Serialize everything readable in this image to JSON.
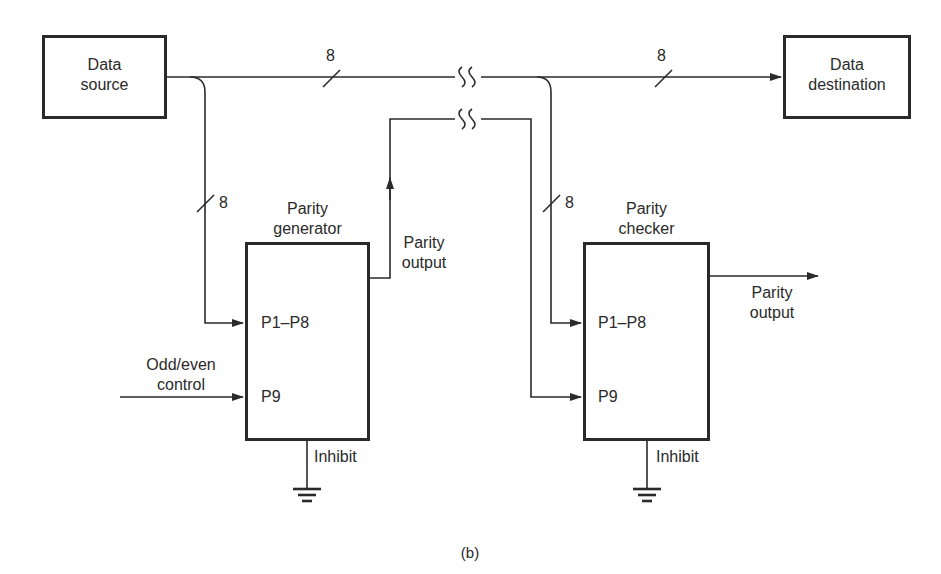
{
  "diagram": {
    "caption": "(b)",
    "blocks": {
      "data_source": {
        "line1": "Data",
        "line2": "source"
      },
      "data_destination": {
        "line1": "Data",
        "line2": "destination"
      },
      "parity_generator": {
        "title_line1": "Parity",
        "title_line2": "generator",
        "inputs": {
          "p1_p8": "P1–P8",
          "p9": "P9"
        },
        "output_label_line1": "Parity",
        "output_label_line2": "output",
        "inhibit": "Inhibit"
      },
      "parity_checker": {
        "title_line1": "Parity",
        "title_line2": "checker",
        "inputs": {
          "p1_p8": "P1–P8",
          "p9": "P9"
        },
        "output_label_line1": "Parity",
        "output_label_line2": "output",
        "inhibit": "Inhibit"
      }
    },
    "control": {
      "line1": "Odd/even",
      "line2": "control"
    },
    "bus_widths": {
      "main_bus_left": "8",
      "main_bus_right": "8",
      "generator_input": "8",
      "checker_input": "8"
    },
    "colors": {
      "ink": "#2a2a2a",
      "background": "#ffffff"
    }
  }
}
